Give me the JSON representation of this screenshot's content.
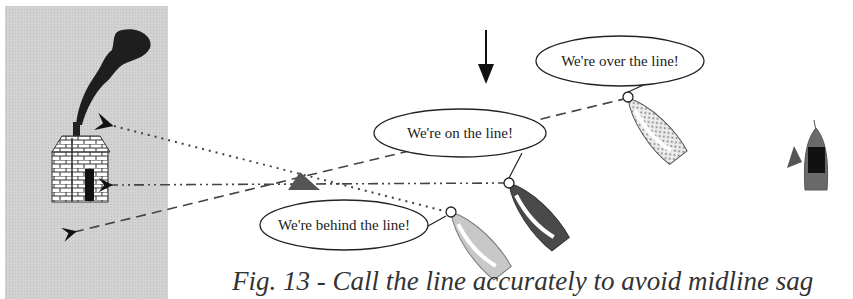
{
  "figure": {
    "caption": "Fig. 13 - Call the line accurately to avoid midline sag",
    "colors": {
      "shore_panel": "#cfcfcf",
      "smoke": "#222222",
      "mark": "#555555",
      "dark_boat": "#4a4a4a",
      "light_boat": "#c8c8c8",
      "dotted_boat": "#e6e6e6",
      "committee_boat": "#6a6a6a"
    }
  },
  "shore": {
    "label": "shore with brick house and chimney smoke",
    "transit_lines": [
      "dotted",
      "dash-dot",
      "dashed"
    ]
  },
  "wind": {
    "icon": "down-arrow-icon"
  },
  "boats": [
    {
      "id": "over",
      "bubble": "We're over the line!"
    },
    {
      "id": "on",
      "bubble": "We're on the line!"
    },
    {
      "id": "behind",
      "bubble": "We're behind the line!"
    }
  ],
  "committee_boat": {
    "label": "committee boat with flag"
  },
  "pin_mark": {
    "label": "pin-end mark"
  }
}
